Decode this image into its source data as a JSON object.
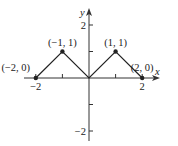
{
  "chart_data": {
    "type": "line",
    "title": "",
    "xlabel": "x",
    "ylabel": "y",
    "xlim": [
      -2.3,
      2.6
    ],
    "ylim": [
      -2.3,
      2.6
    ],
    "grid": false,
    "x_ticks": [
      -2,
      -1,
      1,
      2
    ],
    "y_ticks": [
      -2,
      -1,
      1,
      2
    ],
    "x_tick_labels": [
      {
        "value": -2,
        "label": "−2"
      },
      {
        "value": 2,
        "label": "2"
      }
    ],
    "y_tick_labels": [
      {
        "value": 2,
        "label": "2"
      },
      {
        "value": -2,
        "label": "−2"
      }
    ],
    "series": [
      {
        "name": "f(x)",
        "x": [
          -2,
          -1,
          0,
          1,
          2
        ],
        "y": [
          0,
          1,
          0,
          1,
          0
        ]
      }
    ],
    "annotations": [
      {
        "x": -2,
        "y": 0,
        "text": "(−2, 0)"
      },
      {
        "x": -1,
        "y": 1,
        "text": "(−1, 1)"
      },
      {
        "x": 1,
        "y": 1,
        "text": "(1, 1)"
      },
      {
        "x": 2,
        "y": 0,
        "text": "(2, 0)"
      }
    ],
    "markers": [
      {
        "x": -2,
        "y": 0
      },
      {
        "x": -1,
        "y": 1
      },
      {
        "x": 1,
        "y": 1
      },
      {
        "x": 2,
        "y": 0
      }
    ]
  },
  "colors": {
    "line": "#222222",
    "axis": "#333333",
    "background": "#ffffff"
  }
}
